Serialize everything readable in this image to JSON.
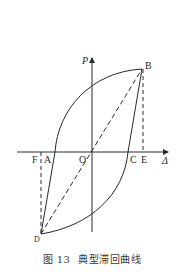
{
  "diagram": {
    "type": "hysteresis-loop",
    "axes": {
      "y_label": "P",
      "x_label": "Δ"
    },
    "points": {
      "B": "B",
      "A": "A",
      "O": "O",
      "C": "C",
      "E": "E",
      "F": "F",
      "D": "D"
    },
    "colors": {
      "line": "#2a2a2a",
      "background": "#ffffff"
    }
  },
  "caption": {
    "number": "图 13",
    "title": "典型滞回曲线"
  }
}
